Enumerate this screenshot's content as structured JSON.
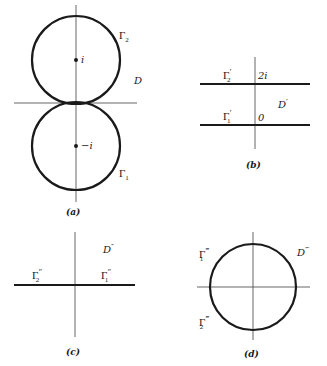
{
  "figure": {
    "panels": [
      {
        "id": "a",
        "caption": "(a)",
        "region_label": "D",
        "curves": [
          {
            "name": "Γ",
            "sub": "2",
            "primes": "",
            "center_label": "i"
          },
          {
            "name": "Γ",
            "sub": "1",
            "primes": "",
            "center_label": "−i"
          }
        ]
      },
      {
        "id": "b",
        "caption": "(b)",
        "region_label": "D",
        "region_primes": "′",
        "curves": [
          {
            "name": "Γ",
            "sub": "2",
            "primes": "′",
            "point_label": "2i"
          },
          {
            "name": "Γ",
            "sub": "1",
            "primes": "′",
            "point_label": "0"
          }
        ]
      },
      {
        "id": "c",
        "caption": "(c)",
        "region_label": "D",
        "region_primes": "″",
        "curves": [
          {
            "name": "Γ",
            "sub": "2",
            "primes": "″"
          },
          {
            "name": "Γ",
            "sub": "1",
            "primes": "″"
          }
        ]
      },
      {
        "id": "d",
        "caption": "(d)",
        "region_label": "D",
        "region_primes": "‴",
        "curves": [
          {
            "name": "Γ",
            "sub": "1",
            "primes": "‴"
          },
          {
            "name": "Γ",
            "sub": "2",
            "primes": "‴"
          }
        ]
      }
    ],
    "colors": {
      "ink": "#1a1a1a",
      "axis": "#555555",
      "background": "#ffffff"
    }
  }
}
